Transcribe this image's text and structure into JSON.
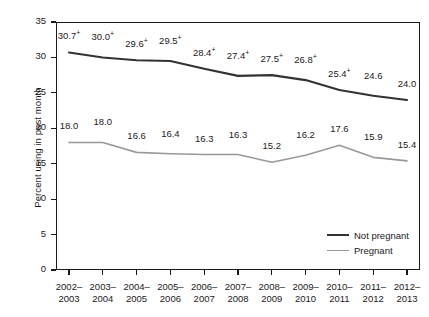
{
  "chart_data": {
    "type": "line",
    "title": "",
    "xlabel": "",
    "ylabel": "Percent using in past month",
    "ylim": [
      0,
      35
    ],
    "yticks": [
      0,
      5,
      10,
      15,
      20,
      25,
      30,
      35
    ],
    "ytick_labels": [
      "0",
      "5",
      "0",
      "15",
      "20",
      "25",
      "30",
      "35"
    ],
    "grid": false,
    "legend_position": "bottom-right-inside",
    "categories": [
      "2002–\n2003",
      "2003–\n2004",
      "2004–\n2005",
      "2005–\n2006",
      "2006–\n2007",
      "2007–\n2008",
      "2008–\n2009",
      "2009–\n2010",
      "2010–\n2011",
      "2011–\n2012",
      "2012–\n2013"
    ],
    "category_lines": [
      [
        "2002–",
        "2003"
      ],
      [
        "2003–",
        "2004"
      ],
      [
        "2004–",
        "2005"
      ],
      [
        "2005–",
        "2006"
      ],
      [
        "2006–",
        "2007"
      ],
      [
        "2007–",
        "2008"
      ],
      [
        "2008–",
        "2009"
      ],
      [
        "2009–",
        "2010"
      ],
      [
        "2010–",
        "2011"
      ],
      [
        "2011–",
        "2012"
      ],
      [
        "2012–",
        "2013"
      ]
    ],
    "series": [
      {
        "name": "Not pregnant",
        "color": "#333333",
        "values": [
          30.7,
          30.0,
          29.6,
          29.5,
          28.4,
          27.4,
          27.5,
          26.8,
          25.4,
          24.6,
          24.0
        ],
        "labels": [
          "30.7",
          "30.0",
          "29.6",
          "29.5",
          "28.4",
          "27.4",
          "27.5",
          "26.8",
          "25.4",
          "24.6",
          "24.0"
        ],
        "markers": [
          "+",
          "+",
          "+",
          "+",
          "+",
          "+",
          "+",
          "+",
          "+",
          "",
          ""
        ]
      },
      {
        "name": "Pregnant",
        "color": "#999999",
        "values": [
          18.0,
          18.0,
          16.6,
          16.4,
          16.3,
          16.3,
          15.2,
          16.2,
          17.6,
          15.9,
          15.4
        ],
        "labels": [
          "18.0",
          "18.0",
          "16.6",
          "16.4",
          "16.3",
          "16.3",
          "15.2",
          "16.2",
          "17.6",
          "15.9",
          "15.4"
        ],
        "markers": [
          "",
          "",
          "",
          "",
          "",
          "",
          "",
          "",
          "",
          "",
          ""
        ]
      }
    ]
  },
  "legend": {
    "items": [
      {
        "label": "Not pregnant",
        "color": "#333333",
        "width": "2.1px"
      },
      {
        "label": "Pregnant",
        "color": "#999999",
        "width": "1.6px"
      }
    ]
  }
}
